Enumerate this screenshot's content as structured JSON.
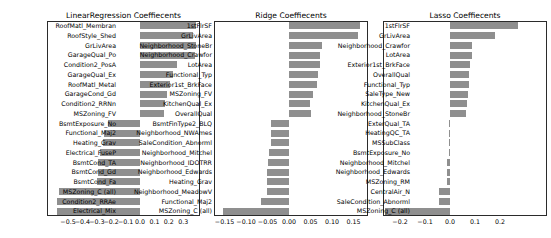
{
  "figure": {
    "background": "#ffffff",
    "bar_color": "#8f8f8f",
    "axis_color": "#2b2b2b",
    "text_color": "#000000"
  },
  "chart_data": [
    {
      "type": "bar",
      "orientation": "horizontal",
      "title": "LinearRegression Coeffiecents",
      "xlabel": "",
      "ylabel": "",
      "grid": false,
      "legend": false,
      "xlim": [
        -0.65,
        0.42
      ],
      "xticks": [
        -0.5,
        -0.4,
        -0.3,
        -0.2,
        -0.1,
        0.0,
        0.1,
        0.2,
        0.3
      ],
      "xtick_decimals": 1,
      "categories": [
        "RoofMatl_Membran",
        "RoofStyle_Shed",
        "GrLivArea",
        "GarageQual_Po",
        "Condition2_PosA",
        "GarageQual_Ex",
        "RoofMatl_Metal",
        "GarageCond_Gd",
        "Condition2_RRNn",
        "MSZoning_FV",
        "BsmtExposure_No",
        "Functional_Maj2",
        "Heating_Grav",
        "Electrical_FuseP",
        "BsmtCond_TA",
        "BsmtCond_Gd",
        "BsmtCond_Fa",
        "MSZoning_C (all)",
        "Condition2_RRAe",
        "Electrical_Mix"
      ],
      "values": [
        0.39,
        0.37,
        0.39,
        0.38,
        0.26,
        0.23,
        0.21,
        0.19,
        0.175,
        0.17,
        -0.22,
        -0.25,
        -0.26,
        -0.28,
        -0.29,
        -0.295,
        -0.3,
        -0.565,
        -0.575,
        -0.575
      ]
    },
    {
      "type": "bar",
      "orientation": "horizontal",
      "title": "Ridge Coeffiecents",
      "xlabel": "",
      "ylabel": "",
      "grid": false,
      "legend": false,
      "xlim": [
        -0.174,
        0.184
      ],
      "xticks": [
        -0.15,
        -0.1,
        -0.05,
        0.0,
        0.05,
        0.1,
        0.15
      ],
      "xtick_decimals": 2,
      "categories": [
        "1stFlrSF",
        "GrLivArea",
        "Neighborhood_StoneBr",
        "Neighborhood_Crawfor",
        "LotArea",
        "Functional_Typ",
        "Exterior1st_BrkFace",
        "MSZoning_FV",
        "KitchenQual_Ex",
        "OverallQual",
        "BsmtFinType2_BLQ",
        "Neighborhood_NWAmes",
        "SaleCondition_Abnorml",
        "Neighborhood_Mitchel",
        "Neighborhood_IDOTRR",
        "Neighborhood_Edwards",
        "Heating_Grav",
        "Neighborhood_MeadowV",
        "Functional_Maj2",
        "MSZoning_C (all)"
      ],
      "values": [
        0.165,
        0.16,
        0.076,
        0.072,
        0.071,
        0.067,
        0.065,
        0.055,
        0.048,
        0.05,
        -0.042,
        -0.043,
        -0.043,
        -0.047,
        -0.05,
        -0.051,
        -0.051,
        -0.052,
        -0.065,
        -0.153
      ]
    },
    {
      "type": "bar",
      "orientation": "horizontal",
      "title": "Lasso Coeffiecents",
      "xlabel": "",
      "ylabel": "",
      "grid": false,
      "legend": false,
      "xlim": [
        -0.268,
        0.388
      ],
      "xticks": [
        -0.2,
        -0.1,
        0.0,
        0.1,
        0.2
      ],
      "xtick_decimals": 1,
      "categories": [
        "1stFlrSF",
        "GrLivArea",
        "Neighborhood_Crawfor",
        "LotArea",
        "Exterior1st_BrkFace",
        "OverallQual",
        "Functional_Typ",
        "SaleType_New",
        "KitchenQual_Ex",
        "Neighborhood_StoneBr",
        "ExterQual_TA",
        "HeatingQC_TA",
        "MSSubClass",
        "BsmtExposure_No",
        "Neighborhood_Mitchel",
        "Neighborhood_Edwards",
        "MSZoning_RM",
        "CentralAir_N",
        "SaleCondition_Abnorml",
        "MSZoning_C (all)"
      ],
      "values": [
        0.27,
        0.18,
        0.089,
        0.088,
        0.08,
        0.077,
        0.075,
        0.071,
        0.066,
        0.065,
        -0.006,
        -0.006,
        -0.006,
        -0.006,
        -0.012,
        -0.012,
        -0.012,
        -0.046,
        -0.046,
        -0.26
      ]
    }
  ]
}
